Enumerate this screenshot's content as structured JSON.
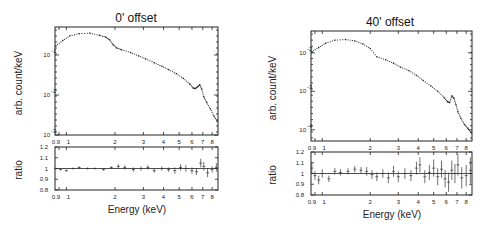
{
  "chart_data": [
    {
      "type": "scatter",
      "title": "0' offset",
      "panels": {
        "spectrum": {
          "ylabel": "arb. count/keV",
          "yscale": "log",
          "ylim": [
            0.001,
            0.5
          ],
          "yticks": [
            {
              "value": 0.1,
              "base": "10",
              "exp": "-1"
            },
            {
              "value": 0.01,
              "base": "10",
              "exp": "-2"
            },
            {
              "value": 0.001,
              "base": "10",
              "exp": "-3"
            }
          ]
        },
        "ratio": {
          "ylabel": "ratio",
          "ylim": [
            0.8,
            1.2
          ],
          "yticks": [
            "1.2",
            "1.1",
            "1",
            "0.9",
            "0.8"
          ],
          "reference": 1.0
        }
      },
      "xlabel": "Energy (keV)",
      "xscale": "log",
      "xlim": [
        0.85,
        8.7
      ],
      "xticks": [
        "0.9",
        "1",
        "2",
        "3",
        "4",
        "5",
        "6",
        "7",
        "8"
      ],
      "series": [
        {
          "name": "spectrum",
          "x": [
            0.86,
            0.95,
            1.05,
            1.2,
            1.4,
            1.6,
            1.75,
            1.85,
            1.95,
            2.05,
            2.2,
            2.5,
            2.8,
            3.1,
            3.5,
            3.9,
            4.3,
            4.8,
            5.3,
            5.8,
            6.1,
            6.3,
            6.5,
            6.7,
            6.9,
            7.1,
            7.4,
            7.8,
            8.2,
            8.6
          ],
          "y": [
            0.17,
            0.23,
            0.3,
            0.34,
            0.35,
            0.31,
            0.28,
            0.24,
            0.18,
            0.15,
            0.135,
            0.115,
            0.095,
            0.08,
            0.064,
            0.052,
            0.043,
            0.034,
            0.026,
            0.019,
            0.015,
            0.0145,
            0.016,
            0.018,
            0.014,
            0.009,
            0.0065,
            0.0045,
            0.003,
            0.0022
          ]
        },
        {
          "name": "ratio",
          "x": [
            0.86,
            0.92,
            1.0,
            1.1,
            1.2,
            1.35,
            1.5,
            1.7,
            1.9,
            2.1,
            2.3,
            2.6,
            2.9,
            3.2,
            3.5,
            3.9,
            4.3,
            4.7,
            5.1,
            5.5,
            6.0,
            6.4,
            6.8,
            7.1,
            7.5,
            8.0,
            8.5
          ],
          "y": [
            1.0,
            0.99,
            0.98,
            1.0,
            1.01,
            1.0,
            1.0,
            0.99,
            1.01,
            1.02,
            1.01,
            0.99,
            1.0,
            1.01,
            0.98,
            1.0,
            0.99,
            0.98,
            1.01,
            1.0,
            0.98,
            0.97,
            1.05,
            1.02,
            0.96,
            0.99,
            1.01
          ],
          "err": [
            0.01,
            0.01,
            0.01,
            0.01,
            0.01,
            0.01,
            0.01,
            0.01,
            0.01,
            0.02,
            0.02,
            0.02,
            0.02,
            0.02,
            0.02,
            0.02,
            0.02,
            0.03,
            0.03,
            0.03,
            0.03,
            0.03,
            0.04,
            0.04,
            0.04,
            0.03,
            0.04
          ]
        }
      ]
    },
    {
      "type": "scatter",
      "title": "40' offset",
      "panels": {
        "spectrum": {
          "ylabel": "arb. count/keV",
          "yscale": "log",
          "ylim": [
            5e-05,
            0.005
          ],
          "yticks": [
            {
              "value": 0.002,
              "base": "10",
              "exp": "-2"
            },
            {
              "value": 0.0004,
              "base": "10",
              "exp": "-3"
            },
            {
              "value": 8e-05,
              "base": "10",
              "exp": "-4"
            }
          ]
        },
        "ratio": {
          "ylabel": "ratio",
          "ylim": [
            0.8,
            1.2
          ],
          "yticks": [
            "1.2",
            "1.1",
            "1",
            "0.9",
            "0.8"
          ],
          "reference": 1.0
        }
      },
      "xlabel": "Energy (keV)",
      "xscale": "log",
      "xlim": [
        0.85,
        8.7
      ],
      "xticks": [
        "0.9",
        "1",
        "2",
        "3",
        "4",
        "5",
        "6",
        "7",
        "8"
      ],
      "series": [
        {
          "name": "spectrum",
          "x": [
            0.86,
            0.95,
            1.05,
            1.2,
            1.4,
            1.6,
            1.8,
            2.0,
            2.2,
            2.5,
            2.8,
            3.1,
            3.5,
            3.9,
            4.3,
            4.8,
            5.3,
            5.8,
            6.1,
            6.3,
            6.5,
            6.7,
            6.9,
            7.1,
            7.4,
            7.8,
            8.2,
            8.6
          ],
          "y": [
            0.0021,
            0.0025,
            0.003,
            0.0034,
            0.0035,
            0.0033,
            0.0029,
            0.0024,
            0.0017,
            0.0015,
            0.0013,
            0.0011,
            0.00095,
            0.00078,
            0.00063,
            0.0005,
            0.0004,
            0.00031,
            0.00026,
            0.00025,
            0.00033,
            0.0003,
            0.00023,
            0.00017,
            0.00013,
            0.0001,
            8.5e-05,
            7e-05
          ]
        },
        {
          "name": "ratio",
          "x": [
            0.86,
            0.9,
            0.95,
            1.0,
            1.1,
            1.2,
            1.3,
            1.45,
            1.6,
            1.75,
            1.9,
            2.05,
            2.2,
            2.4,
            2.6,
            2.8,
            3.0,
            3.3,
            3.6,
            3.9,
            4.1,
            4.4,
            4.7,
            5.0,
            5.3,
            5.6,
            5.9,
            6.2,
            6.5,
            6.8,
            7.1,
            7.5,
            8.0,
            8.5
          ],
          "y": [
            1.05,
            0.98,
            0.94,
            1.0,
            0.95,
            1.02,
            1.01,
            1.02,
            1.04,
            1.03,
            1.02,
            0.99,
            0.97,
            1.0,
            0.96,
            1.02,
            0.97,
            1.0,
            0.98,
            1.05,
            1.08,
            0.97,
            1.01,
            1.05,
            0.97,
            1.04,
            0.95,
            0.92,
            1.03,
            1.0,
            1.08,
            0.96,
            0.98,
            1.03
          ],
          "err": [
            0.05,
            0.04,
            0.04,
            0.04,
            0.03,
            0.03,
            0.03,
            0.03,
            0.03,
            0.03,
            0.04,
            0.04,
            0.04,
            0.04,
            0.05,
            0.05,
            0.05,
            0.05,
            0.05,
            0.06,
            0.07,
            0.06,
            0.07,
            0.08,
            0.08,
            0.08,
            0.08,
            0.09,
            0.09,
            0.09,
            0.1,
            0.1,
            0.1,
            0.12
          ]
        }
      ]
    }
  ]
}
